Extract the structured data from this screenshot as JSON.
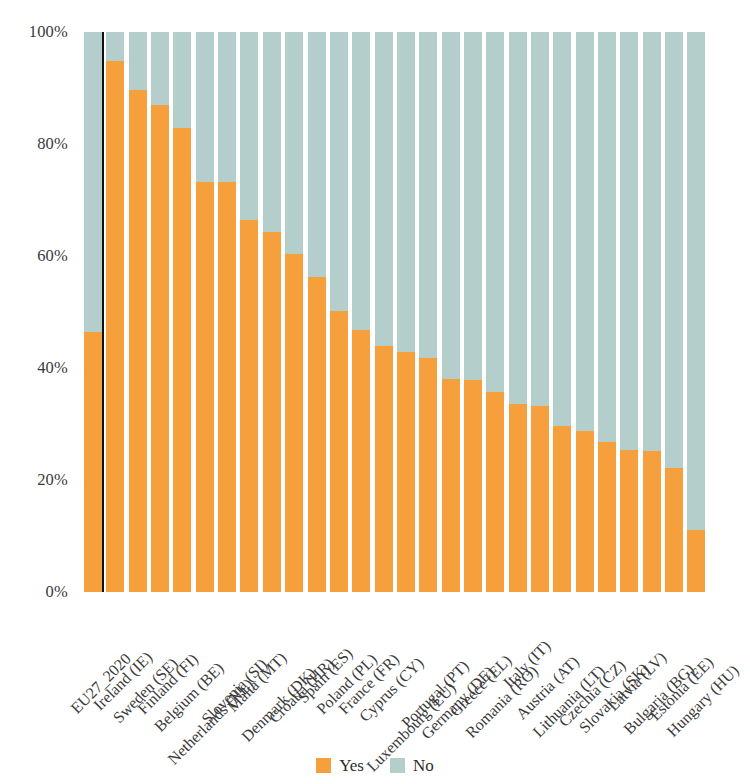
{
  "chart_data": {
    "type": "bar",
    "subtype": "stacked-100-percent",
    "title": "",
    "subtitle": "",
    "xlabel": "",
    "ylabel": "",
    "ylim": [
      0,
      100
    ],
    "ytick_labels": [
      "100%",
      "80%",
      "60%",
      "40%",
      "20%",
      "0%"
    ],
    "ytick_values": [
      100,
      80,
      60,
      40,
      20,
      0
    ],
    "grid": false,
    "legend_position": "bottom-center",
    "categories": [
      "EU27_2020",
      "Ireland (IE)",
      "Sweden (SE)",
      "Finland (FI)",
      "Belgium (BE)",
      "Netherlands (NL)",
      "Slovenia (SI)",
      "Malta (MT)",
      "Denmark (DK)",
      "Croatia (HR)",
      "Spain (ES)",
      "Poland (PL)",
      "France (FR)",
      "Cyprus (CY)",
      "Luxembourg (LU)",
      "Portugal (PT)",
      "Germany (DE)",
      "Greece (EL)",
      "Romania (RO)",
      "Italy (IT)",
      "Austria (AT)",
      "Lithuania (LT)",
      "Czechia (CZ)",
      "Slovakia (SK)",
      "Latvia (LV)",
      "Bulgaria (BG)",
      "Estonia (EE)",
      "Hungary (HU)"
    ],
    "series": [
      {
        "name": "Yes",
        "color": "#F5A03C",
        "values": [
          46.4,
          94.8,
          89.6,
          86.9,
          82.8,
          73.2,
          73.2,
          66.5,
          64.3,
          60.4,
          56.3,
          50.2,
          46.8,
          43.9,
          42.8,
          41.8,
          38.0,
          37.8,
          35.8,
          33.5,
          33.3,
          29.6,
          28.7,
          26.7,
          25.3,
          25.1,
          22.2,
          11.1
        ]
      },
      {
        "name": "No",
        "color": "#B4CFCB",
        "values": [
          53.6,
          5.2,
          10.4,
          13.1,
          17.2,
          26.8,
          26.8,
          33.5,
          35.7,
          39.6,
          43.7,
          49.8,
          53.2,
          56.1,
          57.2,
          58.2,
          62.0,
          62.2,
          64.2,
          66.5,
          66.7,
          70.4,
          71.3,
          73.3,
          74.7,
          74.9,
          77.8,
          88.9
        ]
      }
    ],
    "annotations": [
      {
        "type": "vertical-reference-line",
        "after_category_index": 0,
        "color": "#111111"
      }
    ]
  },
  "legend": {
    "items": [
      {
        "label": "Yes",
        "color": "#F5A03C"
      },
      {
        "label": "No",
        "color": "#B4CFCB"
      }
    ]
  },
  "colors": {
    "yes": "#F5A03C",
    "no": "#B4CFCB",
    "reference_line": "#111111",
    "background": "#FFFFFF",
    "text": "#3A3A3A"
  }
}
